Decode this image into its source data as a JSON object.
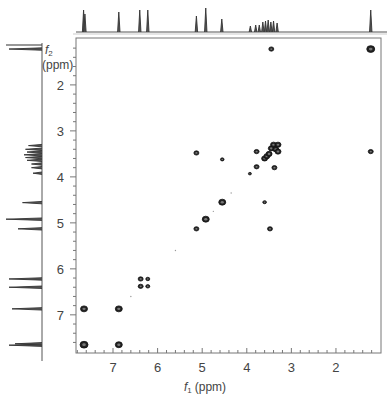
{
  "chart_data": {
    "type": "heatmap",
    "subtype": "2D NMR COSY contour plot",
    "title": "",
    "xlabel": "f1 (ppm)",
    "ylabel": "f2 (ppm)",
    "xlabel_main": "f",
    "xlabel_sub": "1",
    "xlabel_unit": "(ppm)",
    "ylabel_main": "f",
    "ylabel_sub": "2",
    "ylabel_unit": "(ppm)",
    "xlim": [
      7.83,
      0.99
    ],
    "ylim": [
      0.98,
      7.83
    ],
    "x_ticks": [
      7,
      6,
      5,
      4,
      3,
      2
    ],
    "y_ticks": [
      2,
      3,
      4,
      5,
      6,
      7
    ],
    "grid": false,
    "legend": null,
    "cross_peaks": [
      {
        "f1": 7.65,
        "f2": 7.65,
        "size": 4
      },
      {
        "f1": 7.65,
        "f2": 6.87,
        "size": 3.5
      },
      {
        "f1": 6.87,
        "f2": 7.65,
        "size": 3.5
      },
      {
        "f1": 6.87,
        "f2": 6.87,
        "size": 3.5
      },
      {
        "f1": 6.38,
        "f2": 6.38,
        "size": 2.5
      },
      {
        "f1": 6.38,
        "f2": 6.22,
        "size": 2.5
      },
      {
        "f1": 6.22,
        "f2": 6.38,
        "size": 2.0
      },
      {
        "f1": 6.22,
        "f2": 6.22,
        "size": 2.0
      },
      {
        "f1": 5.13,
        "f2": 5.13,
        "size": 2.5
      },
      {
        "f1": 5.13,
        "f2": 3.48,
        "size": 2.5
      },
      {
        "f1": 4.92,
        "f2": 4.92,
        "size": 3.5
      },
      {
        "f1": 4.55,
        "f2": 4.55,
        "size": 3.5
      },
      {
        "f1": 4.55,
        "f2": 3.62,
        "size": 1.8
      },
      {
        "f1": 3.93,
        "f2": 3.93,
        "size": 1.5
      },
      {
        "f1": 3.78,
        "f2": 3.45,
        "size": 2.5
      },
      {
        "f1": 3.78,
        "f2": 3.78,
        "size": 2.5
      },
      {
        "f1": 3.6,
        "f2": 4.55,
        "size": 1.8
      },
      {
        "f1": 3.6,
        "f2": 3.6,
        "size": 3
      },
      {
        "f1": 3.55,
        "f2": 3.55,
        "size": 3
      },
      {
        "f1": 3.5,
        "f2": 3.5,
        "size": 3
      },
      {
        "f1": 3.45,
        "f2": 3.38,
        "size": 3
      },
      {
        "f1": 3.4,
        "f2": 3.3,
        "size": 3
      },
      {
        "f1": 3.35,
        "f2": 3.4,
        "size": 3
      },
      {
        "f1": 3.3,
        "f2": 3.3,
        "size": 3
      },
      {
        "f1": 3.3,
        "f2": 3.45,
        "size": 3
      },
      {
        "f1": 3.48,
        "f2": 5.13,
        "size": 2.5
      },
      {
        "f1": 3.38,
        "f2": 3.8,
        "size": 2.5
      },
      {
        "f1": 3.45,
        "f2": 1.22,
        "size": 2.5
      },
      {
        "f1": 1.22,
        "f2": 1.22,
        "size": 4
      },
      {
        "f1": 1.22,
        "f2": 3.45,
        "size": 2.5
      }
    ],
    "projection_peaks_f1": [
      {
        "ppm": 7.66,
        "height": 22
      },
      {
        "ppm": 7.63,
        "height": 18
      },
      {
        "ppm": 6.87,
        "height": 20
      },
      {
        "ppm": 6.4,
        "height": 22
      },
      {
        "ppm": 6.22,
        "height": 22
      },
      {
        "ppm": 5.13,
        "height": 16
      },
      {
        "ppm": 4.92,
        "height": 24
      },
      {
        "ppm": 4.56,
        "height": 13
      },
      {
        "ppm": 3.92,
        "height": 6
      },
      {
        "ppm": 3.8,
        "height": 7
      },
      {
        "ppm": 3.72,
        "height": 7
      },
      {
        "ppm": 3.64,
        "height": 10
      },
      {
        "ppm": 3.58,
        "height": 11
      },
      {
        "ppm": 3.52,
        "height": 12
      },
      {
        "ppm": 3.46,
        "height": 10
      },
      {
        "ppm": 3.4,
        "height": 11
      },
      {
        "ppm": 3.32,
        "height": 9
      },
      {
        "ppm": 1.22,
        "height": 22
      }
    ]
  },
  "axes": {
    "x_tick_labels": [
      "7",
      "6",
      "5",
      "4",
      "3",
      "2"
    ],
    "y_tick_labels": [
      "2",
      "3",
      "4",
      "5",
      "6",
      "7"
    ]
  }
}
